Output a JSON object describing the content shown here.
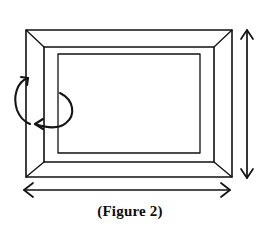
{
  "figure": {
    "caption": "(Figure 2)",
    "line_color": "#111111",
    "background_color": "#ffffff",
    "fill_color": "#ffffff"
  },
  "frame": {
    "outer_rect": {
      "x": 26,
      "y": 30,
      "width": 206,
      "height": 147
    },
    "middle_rect": {
      "x": 44,
      "y": 47,
      "width": 170,
      "height": 115
    },
    "inner_rect": {
      "x": 58,
      "y": 54,
      "width": 142,
      "height": 99
    },
    "miter_corners": [
      "top-left",
      "top-right",
      "bottom-left",
      "bottom-right"
    ]
  },
  "annotations": {
    "width_arrow": {
      "label": "width-dimension-arrow",
      "orientation": "horizontal",
      "double_headed": true,
      "x1": 24,
      "x2": 230,
      "y": 190
    },
    "height_arrow": {
      "label": "height-dimension-arrow",
      "orientation": "vertical",
      "double_headed": true,
      "y1": 30,
      "y2": 178,
      "x": 247
    },
    "rotation_arrow_outer": {
      "label": "outer-rotation-arrow",
      "direction": "counter-clockwise",
      "head": "up-right"
    },
    "rotation_arrow_inner": {
      "label": "inner-rotation-arrow",
      "direction": "sweeping-left",
      "head": "left"
    }
  }
}
